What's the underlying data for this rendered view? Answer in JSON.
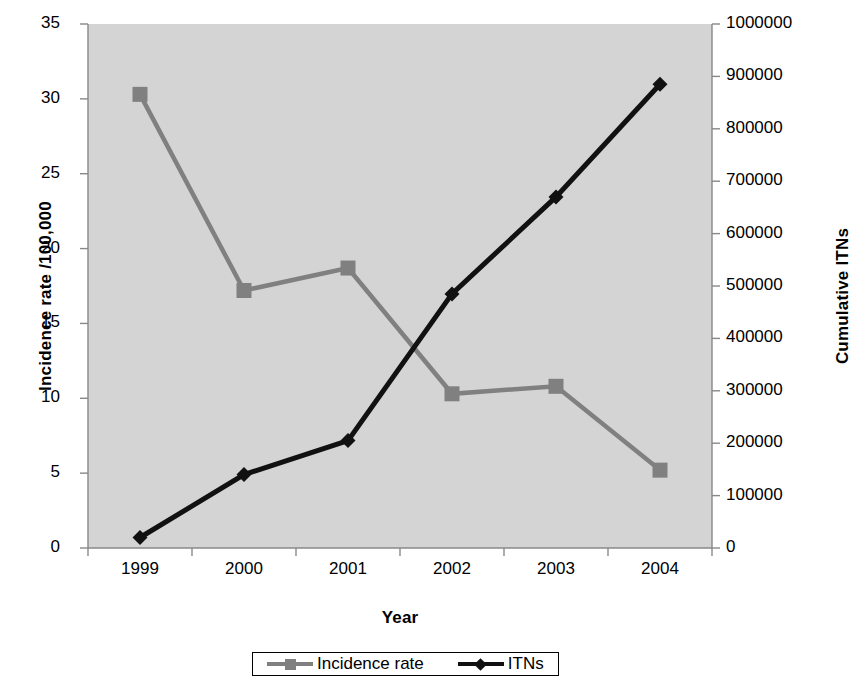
{
  "chart_data": {
    "type": "line",
    "title": "",
    "xlabel": "Year",
    "categories": [
      "1999",
      "2000",
      "2001",
      "2002",
      "2003",
      "2004"
    ],
    "grid": false,
    "legend_position": "bottom",
    "plot_background": "#d4d4d4",
    "axes": [
      {
        "id": "left",
        "label": "Incidence rate /100,000",
        "lim": [
          0,
          35
        ],
        "ticks": [
          0,
          5,
          10,
          15,
          20,
          25,
          30,
          35
        ],
        "tick_labels": [
          "0",
          "5",
          "10",
          "15",
          "20",
          "25",
          "30",
          "35"
        ]
      },
      {
        "id": "right",
        "label": "Cumulative ITNs",
        "lim": [
          0,
          1000000
        ],
        "ticks": [
          0,
          100000,
          200000,
          300000,
          400000,
          500000,
          600000,
          700000,
          800000,
          900000,
          1000000
        ],
        "tick_labels": [
          "0",
          "100000",
          "200000",
          "300000",
          "400000",
          "500000",
          "600000",
          "700000",
          "800000",
          "900000",
          "1000000"
        ]
      }
    ],
    "series": [
      {
        "name": "Incidence rate",
        "axis": "left",
        "color": "#808080",
        "marker": "square",
        "values": [
          30.3,
          17.2,
          18.7,
          10.3,
          10.8,
          5.2
        ]
      },
      {
        "name": "ITNs",
        "axis": "right",
        "color": "#111111",
        "marker": "diamond",
        "values": [
          20000,
          140000,
          205000,
          485000,
          670000,
          885000
        ]
      }
    ]
  },
  "legend": {
    "entries": [
      {
        "label": "Incidence rate"
      },
      {
        "label": "ITNs"
      }
    ]
  }
}
